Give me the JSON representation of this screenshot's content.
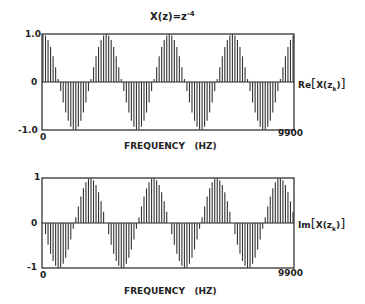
{
  "title": "X(z)=z",
  "title_exp": "-4",
  "chart_data": [
    {
      "type": "bar",
      "title": "X(z)=z^-4",
      "xlabel": "FREQUENCY (HZ)",
      "ylabel": "Re[X(z_k)]",
      "x_ticks": [
        "0",
        "9900"
      ],
      "y_ticks": [
        "1.0",
        "0",
        "-1.0"
      ],
      "xlim": [
        0,
        9900
      ],
      "ylim": [
        -1,
        1
      ],
      "n_points": 100,
      "x_step": 100,
      "formula": "cos(2*pi*4*k/100)",
      "periods": 4
    },
    {
      "type": "bar",
      "xlabel": "FREQUENCY (HZ)",
      "ylabel": "Im[X(z_k)]",
      "x_ticks": [
        "0",
        "9900"
      ],
      "y_ticks": [
        "1",
        "0",
        "-1"
      ],
      "xlim": [
        0,
        9900
      ],
      "ylim": [
        -1,
        1
      ],
      "n_points": 100,
      "x_step": 100,
      "formula": "-sin(2*pi*4*k/100)",
      "periods": 4
    }
  ],
  "top": {
    "y_max": "1.0",
    "y_zero": "0",
    "y_min": "-1.0",
    "x_min": "0",
    "x_max": "9900",
    "xlabel": "FREQUENCY   (HZ)",
    "series_label_prefix": "Re",
    "series_label": "X(z",
    "series_sub": "k",
    "series_end": ")"
  },
  "bottom": {
    "y_max": "1",
    "y_zero": "0",
    "y_min": "-1",
    "x_min": "0",
    "x_max": "9900",
    "xlabel": "FREQUENCY   (HZ)",
    "series_label_prefix": "Im",
    "series_label": "X(z",
    "series_sub": "k",
    "series_end": ")"
  }
}
